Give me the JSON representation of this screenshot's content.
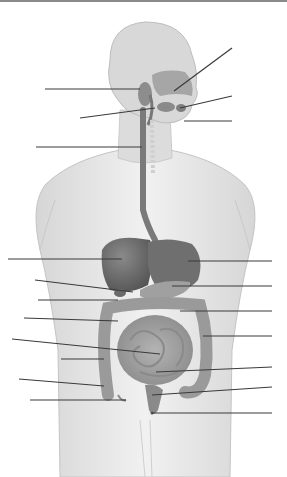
{
  "diagram": {
    "title": "",
    "colors": {
      "skin": "#e4e4e4",
      "skin_outline": "#b8b8b8",
      "organ_dark": "#6e6e6e",
      "organ_mid": "#8c8c8c",
      "organ_light": "#a8a8a8",
      "leader_line": "#3a3a3a",
      "background": "#ffffff"
    },
    "leader_lines": [
      {
        "id": "L1",
        "side": "left",
        "x1": 45,
        "y1": 89,
        "x2": 140,
        "y2": 89
      },
      {
        "id": "L2",
        "side": "left",
        "x1": 80,
        "y1": 118,
        "x2": 155,
        "y2": 108
      },
      {
        "id": "L3",
        "side": "left",
        "x1": 36,
        "y1": 147,
        "x2": 142,
        "y2": 147
      },
      {
        "id": "L4",
        "side": "left",
        "x1": 8,
        "y1": 259,
        "x2": 122,
        "y2": 259
      },
      {
        "id": "L5",
        "side": "left",
        "x1": 35,
        "y1": 280,
        "x2": 133,
        "y2": 292
      },
      {
        "id": "L6",
        "side": "left",
        "x1": 38,
        "y1": 300,
        "x2": 118,
        "y2": 300
      },
      {
        "id": "L7",
        "side": "left",
        "x1": 24,
        "y1": 318,
        "x2": 118,
        "y2": 321
      },
      {
        "id": "L8",
        "side": "left",
        "x1": 12,
        "y1": 339,
        "x2": 160,
        "y2": 354
      },
      {
        "id": "L9",
        "side": "left",
        "x1": 61,
        "y1": 359,
        "x2": 104,
        "y2": 359
      },
      {
        "id": "L10",
        "side": "left",
        "x1": 19,
        "y1": 379,
        "x2": 104,
        "y2": 386
      },
      {
        "id": "L11",
        "side": "left",
        "x1": 30,
        "y1": 400,
        "x2": 126,
        "y2": 400
      },
      {
        "id": "R1",
        "side": "right",
        "x1": 232,
        "y1": 48,
        "x2": 174,
        "y2": 91
      },
      {
        "id": "R2",
        "side": "right",
        "x1": 232,
        "y1": 96,
        "x2": 180,
        "y2": 108
      },
      {
        "id": "R3",
        "side": "right",
        "x1": 232,
        "y1": 121,
        "x2": 184,
        "y2": 121
      },
      {
        "id": "R4",
        "side": "right",
        "x1": 272,
        "y1": 261,
        "x2": 188,
        "y2": 261
      },
      {
        "id": "R5",
        "side": "right",
        "x1": 272,
        "y1": 286,
        "x2": 172,
        "y2": 286
      },
      {
        "id": "R6",
        "side": "right",
        "x1": 272,
        "y1": 311,
        "x2": 180,
        "y2": 311
      },
      {
        "id": "R7",
        "side": "right",
        "x1": 272,
        "y1": 336,
        "x2": 203,
        "y2": 336
      },
      {
        "id": "R8",
        "side": "right",
        "x1": 272,
        "y1": 367,
        "x2": 156,
        "y2": 372
      },
      {
        "id": "R9",
        "side": "right",
        "x1": 272,
        "y1": 387,
        "x2": 152,
        "y2": 395
      },
      {
        "id": "R10",
        "side": "right",
        "x1": 272,
        "y1": 413,
        "x2": 152,
        "y2": 413
      }
    ],
    "labels": []
  }
}
